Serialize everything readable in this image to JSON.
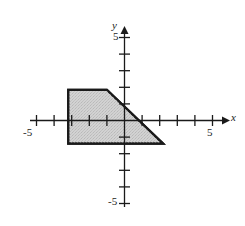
{
  "chart_data": {
    "type": "area",
    "title": "",
    "xlabel": "x",
    "ylabel": "y",
    "xlim": [
      -6.5,
      6.5
    ],
    "ylim": [
      -6,
      6
    ],
    "grid": false,
    "legend": null,
    "x_tick_labels": [
      "-5",
      "5"
    ],
    "y_tick_labels": [
      "5",
      "-5"
    ],
    "x_ticks": [
      -5,
      -4,
      -3,
      -2,
      -1,
      1,
      2,
      3,
      4,
      5
    ],
    "y_ticks": [
      5,
      4,
      3,
      2,
      1,
      -1,
      -2,
      -3,
      -4,
      -5
    ],
    "shaded_region": {
      "name": "feasible-region",
      "fill_color": "#d2d2d2",
      "stroke_color": "#1a1a1a",
      "vertices": [
        [
          -3.2,
          1.85
        ],
        [
          -1.0,
          1.85
        ],
        [
          2.2,
          -1.4
        ],
        [
          -3.2,
          -1.4
        ]
      ]
    }
  },
  "axes": {
    "x_axis_label": "x",
    "y_axis_label": "y",
    "x_negative_tick": "-5",
    "x_positive_tick": "5",
    "y_positive_tick": "5",
    "y_negative_tick": "-5",
    "axis_color": "#1a1a1a"
  }
}
